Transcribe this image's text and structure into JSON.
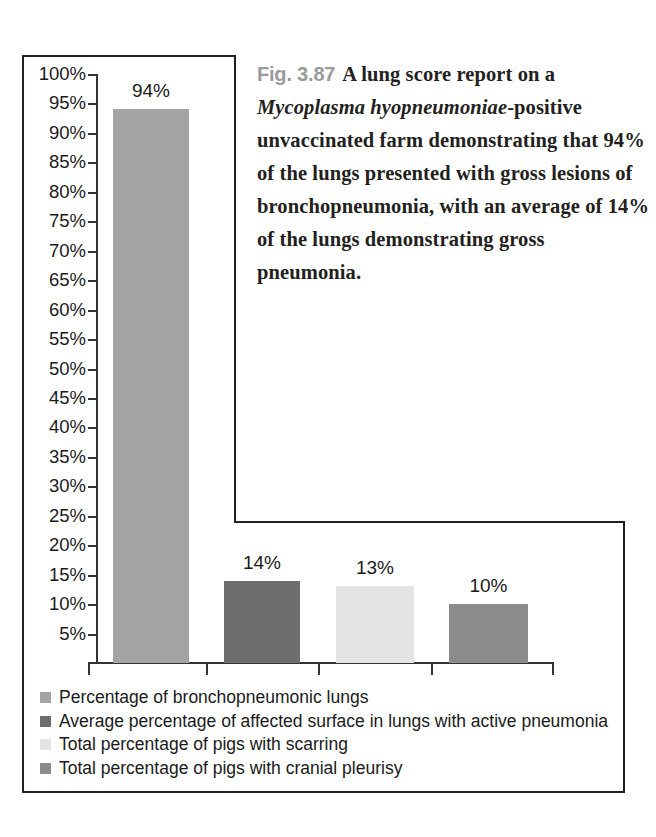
{
  "caption": {
    "figure_number": "Fig. 3.87",
    "text_before_species": "A lung score report on a ",
    "species": "Mycoplasma hyopneumoniae",
    "text_after_species": "-positive unvaccinated farm demonstrating that 94% of the lungs presented with gross lesions of bronchopneumonia, with an average of 14% of the lungs demonstrating gross pneumonia."
  },
  "chart_data": {
    "type": "bar",
    "title": "",
    "xlabel": "",
    "ylabel": "",
    "ylim": [
      0,
      100
    ],
    "grid": false,
    "legend_position": "bottom-left",
    "categories": [
      "Percentage of bronchopneumonic lungs",
      "Average percentage of affected surface in lungs with active pneumonia",
      "Total percentage of pigs with scarring",
      "Total percentage of pigs with cranial pleurisy"
    ],
    "values": [
      94,
      14,
      13,
      10
    ],
    "data_labels": [
      "94%",
      "14%",
      "13%",
      "10%"
    ],
    "colors": [
      "#a3a3a3",
      "#6e6e6e",
      "#e4e4e4",
      "#8c8c8c"
    ],
    "ytick_labels": [
      "100%",
      "95%",
      "90%",
      "85%",
      "80%",
      "75%",
      "70%",
      "65%",
      "60%",
      "55%",
      "50%",
      "45%",
      "40%",
      "35%",
      "30%",
      "25%",
      "20%",
      "15%",
      "10%",
      "5%"
    ],
    "ytick_values": [
      100,
      95,
      90,
      85,
      80,
      75,
      70,
      65,
      60,
      55,
      50,
      45,
      40,
      35,
      30,
      25,
      20,
      15,
      10,
      5
    ]
  },
  "legend": {
    "items": [
      {
        "label": "Percentage of bronchopneumonic lungs",
        "color": "#a3a3a3"
      },
      {
        "label": "Average percentage of affected surface in lungs with active pneumonia",
        "color": "#6e6e6e"
      },
      {
        "label": "Total percentage of pigs with scarring",
        "color": "#e4e4e4"
      },
      {
        "label": "Total percentage of pigs with cranial pleurisy",
        "color": "#8c8c8c"
      }
    ]
  }
}
